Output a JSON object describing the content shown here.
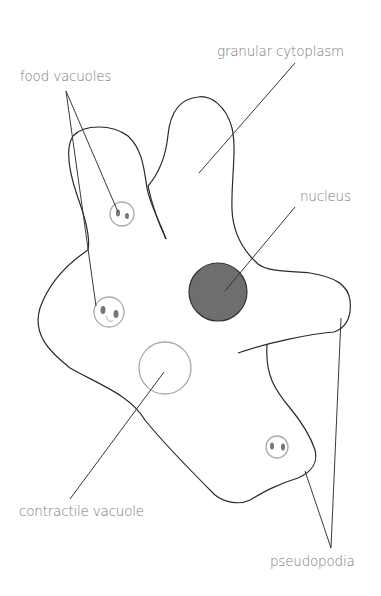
{
  "diagram": {
    "labels": {
      "granular_cytoplasm": "granular cytoplasm",
      "food_vacuoles": "food vacuoles",
      "nucleus": "nucleus",
      "contractile_vacuole": "contractile vacuole",
      "pseudopodia": "pseudopodia"
    },
    "colors": {
      "outline": "#2a2a2a",
      "leader_line": "#3a3a3a",
      "label_text": "#7a7a7a",
      "nucleus_fill": "#6e6e6e",
      "vacuole_outline": "#aaaaaa",
      "food_particle": "#777777"
    }
  }
}
